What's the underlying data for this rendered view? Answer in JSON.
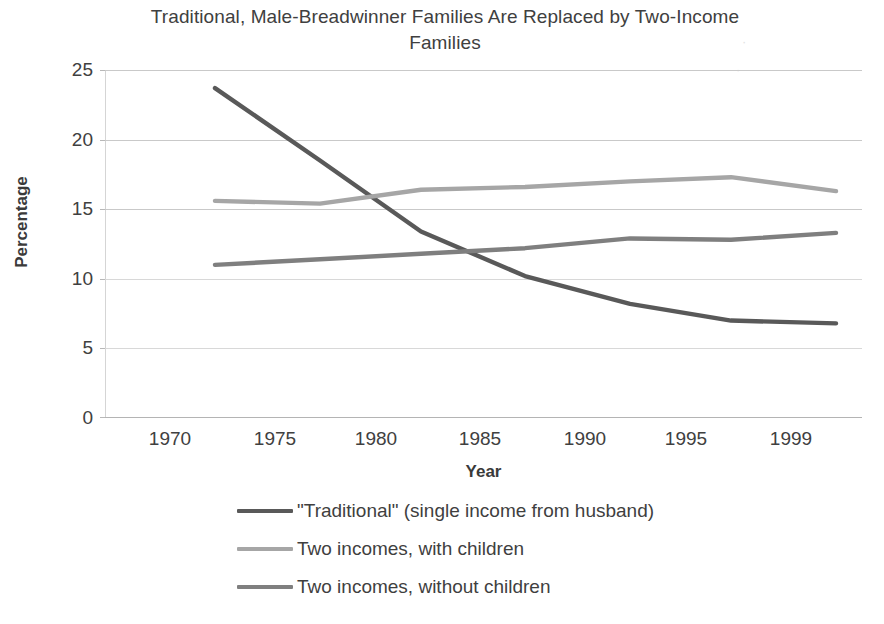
{
  "chart_data": {
    "type": "line",
    "title": "Traditional, Male-Breadwinner Families Are Replaced by Two-Income Families",
    "xlabel": "Year",
    "ylabel": "Percentage",
    "categories": [
      "1970",
      "1975",
      "1980",
      "1985",
      "1990",
      "1995",
      "1999"
    ],
    "x": [
      1970,
      1975,
      1980,
      1985,
      1990,
      1995,
      1999
    ],
    "ylim": [
      0,
      25
    ],
    "ytick_labels": [
      "25",
      "20",
      "15",
      "10",
      "5",
      "0"
    ],
    "yticks": [
      25,
      20,
      15,
      10,
      5,
      0
    ],
    "grid": true,
    "legend_position": "bottom",
    "series": [
      {
        "name": "\"Traditional\" (single income from husband)",
        "color": "#595959",
        "values": [
          23.7,
          18.5,
          13.4,
          10.2,
          8.2,
          7.0,
          6.8
        ]
      },
      {
        "name": "Two incomes, with children",
        "color": "#a6a6a6",
        "values": [
          15.6,
          15.4,
          16.4,
          16.6,
          17.0,
          17.3,
          16.3
        ]
      },
      {
        "name": "Two incomes, without children",
        "color": "#7f7f7f",
        "values": [
          11.0,
          11.4,
          11.8,
          12.2,
          12.9,
          12.8,
          13.3
        ]
      }
    ]
  },
  "legend": {
    "items": [
      {
        "label": "\"Traditional\" (single income from husband)",
        "color": "#595959"
      },
      {
        "label": "Two incomes, with children",
        "color": "#a6a6a6"
      },
      {
        "label": "Two incomes, without children",
        "color": "#7f7f7f"
      }
    ]
  },
  "colors": {
    "gridline": "#c9c9c9",
    "text": "#404040",
    "background": "#ffffff"
  }
}
